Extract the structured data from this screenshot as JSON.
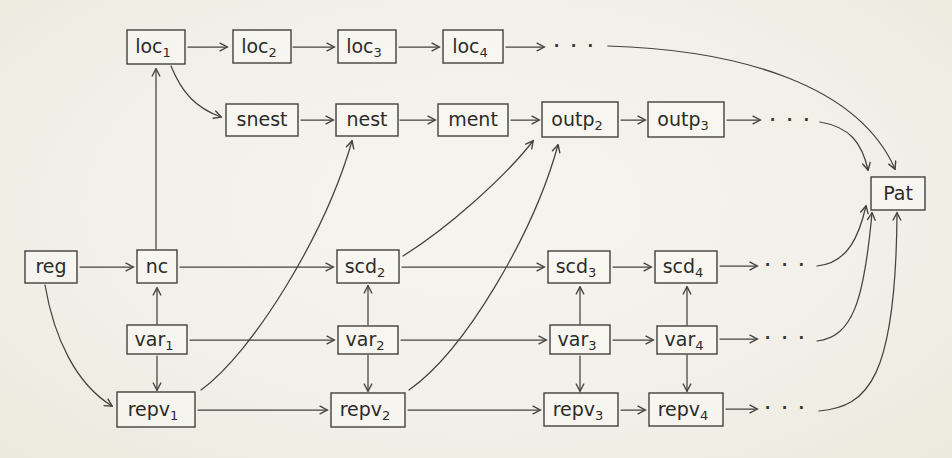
{
  "page": {
    "background_color": "#f2f0e9",
    "ink_color": "#45433f"
  },
  "ellipsis": "· · ·",
  "nodes": {
    "loc1": {
      "text": "loc",
      "sub": "1"
    },
    "loc2": {
      "text": "loc",
      "sub": "2"
    },
    "loc3": {
      "text": "loc",
      "sub": "3"
    },
    "loc4": {
      "text": "loc",
      "sub": "4"
    },
    "snest": {
      "text": "snest",
      "sub": ""
    },
    "nest": {
      "text": "nest",
      "sub": ""
    },
    "ment": {
      "text": "ment",
      "sub": ""
    },
    "outp2": {
      "text": "outp",
      "sub": "2"
    },
    "outp3": {
      "text": "outp",
      "sub": "3"
    },
    "reg": {
      "text": "reg",
      "sub": ""
    },
    "nc": {
      "text": "nc",
      "sub": ""
    },
    "scd2": {
      "text": "scd",
      "sub": "2"
    },
    "scd3": {
      "text": "scd",
      "sub": "3"
    },
    "scd4": {
      "text": "scd",
      "sub": "4"
    },
    "var1": {
      "text": "var",
      "sub": "1"
    },
    "var2": {
      "text": "var",
      "sub": "2"
    },
    "var3": {
      "text": "var",
      "sub": "3"
    },
    "var4": {
      "text": "var",
      "sub": "4"
    },
    "repv1": {
      "text": "repv",
      "sub": "1"
    },
    "repv2": {
      "text": "repv",
      "sub": "2"
    },
    "repv3": {
      "text": "repv",
      "sub": "3"
    },
    "repv4": {
      "text": "repv",
      "sub": "4"
    },
    "pat": {
      "text": "Pat",
      "sub": ""
    }
  },
  "edges": [
    {
      "from": "loc1",
      "to": "loc2"
    },
    {
      "from": "loc2",
      "to": "loc3"
    },
    {
      "from": "loc3",
      "to": "loc4"
    },
    {
      "from": "loc4",
      "to": "loc-ellipsis"
    },
    {
      "from": "loc-ellipsis",
      "to": "pat"
    },
    {
      "from": "loc1",
      "to": "snest"
    },
    {
      "from": "snest",
      "to": "nest"
    },
    {
      "from": "nest",
      "to": "ment"
    },
    {
      "from": "ment",
      "to": "outp2"
    },
    {
      "from": "outp2",
      "to": "outp3"
    },
    {
      "from": "outp3",
      "to": "outp-ellipsis"
    },
    {
      "from": "outp-ellipsis",
      "to": "pat"
    },
    {
      "from": "reg",
      "to": "nc"
    },
    {
      "from": "nc",
      "to": "loc1"
    },
    {
      "from": "nc",
      "to": "scd2"
    },
    {
      "from": "scd2",
      "to": "scd3"
    },
    {
      "from": "scd2",
      "to": "outp2"
    },
    {
      "from": "scd3",
      "to": "scd4"
    },
    {
      "from": "scd4",
      "to": "scd-ellipsis"
    },
    {
      "from": "scd-ellipsis",
      "to": "pat"
    },
    {
      "from": "var1",
      "to": "nc"
    },
    {
      "from": "var1",
      "to": "var2"
    },
    {
      "from": "var1",
      "to": "repv1"
    },
    {
      "from": "var2",
      "to": "scd2"
    },
    {
      "from": "var2",
      "to": "var3"
    },
    {
      "from": "var2",
      "to": "repv2"
    },
    {
      "from": "var3",
      "to": "scd3"
    },
    {
      "from": "var3",
      "to": "var4"
    },
    {
      "from": "var3",
      "to": "repv3"
    },
    {
      "from": "var4",
      "to": "scd4"
    },
    {
      "from": "var4",
      "to": "var-ellipsis"
    },
    {
      "from": "var4",
      "to": "repv4"
    },
    {
      "from": "var-ellipsis",
      "to": "pat"
    },
    {
      "from": "reg",
      "to": "repv1"
    },
    {
      "from": "repv1",
      "to": "nest"
    },
    {
      "from": "repv1",
      "to": "repv2"
    },
    {
      "from": "repv2",
      "to": "outp2"
    },
    {
      "from": "repv2",
      "to": "repv3"
    },
    {
      "from": "repv3",
      "to": "repv4"
    },
    {
      "from": "repv4",
      "to": "repv-ellipsis"
    },
    {
      "from": "repv-ellipsis",
      "to": "pat"
    }
  ]
}
